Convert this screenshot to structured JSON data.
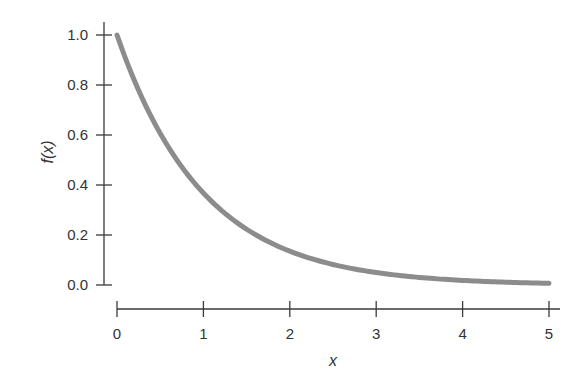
{
  "chart_data": {
    "type": "line",
    "title": "",
    "xlabel": "x",
    "ylabel": "f(x)",
    "function": "f(x) = e^(-x)",
    "xlim": [
      0,
      5
    ],
    "ylim": [
      0,
      1
    ],
    "grid": false,
    "legend": null,
    "x_ticks": [
      0,
      1,
      2,
      3,
      4,
      5
    ],
    "x_tick_labels": [
      "0",
      "1",
      "2",
      "3",
      "4",
      "5"
    ],
    "y_ticks": [
      0.0,
      0.2,
      0.4,
      0.6,
      0.8,
      1.0
    ],
    "y_tick_labels": [
      "0.0",
      "0.2",
      "0.4",
      "0.6",
      "0.8",
      "1.0"
    ],
    "series": [
      {
        "name": "f(x)",
        "color": "#8c8c8c",
        "x": [
          0,
          0.25,
          0.5,
          0.75,
          1,
          1.25,
          1.5,
          1.75,
          2,
          2.25,
          2.5,
          2.75,
          3,
          3.25,
          3.5,
          3.75,
          4,
          4.25,
          4.5,
          4.75,
          5
        ],
        "y": [
          1.0,
          0.779,
          0.607,
          0.472,
          0.368,
          0.287,
          0.223,
          0.174,
          0.135,
          0.105,
          0.082,
          0.064,
          0.05,
          0.039,
          0.03,
          0.024,
          0.018,
          0.014,
          0.011,
          0.009,
          0.007
        ]
      }
    ]
  }
}
